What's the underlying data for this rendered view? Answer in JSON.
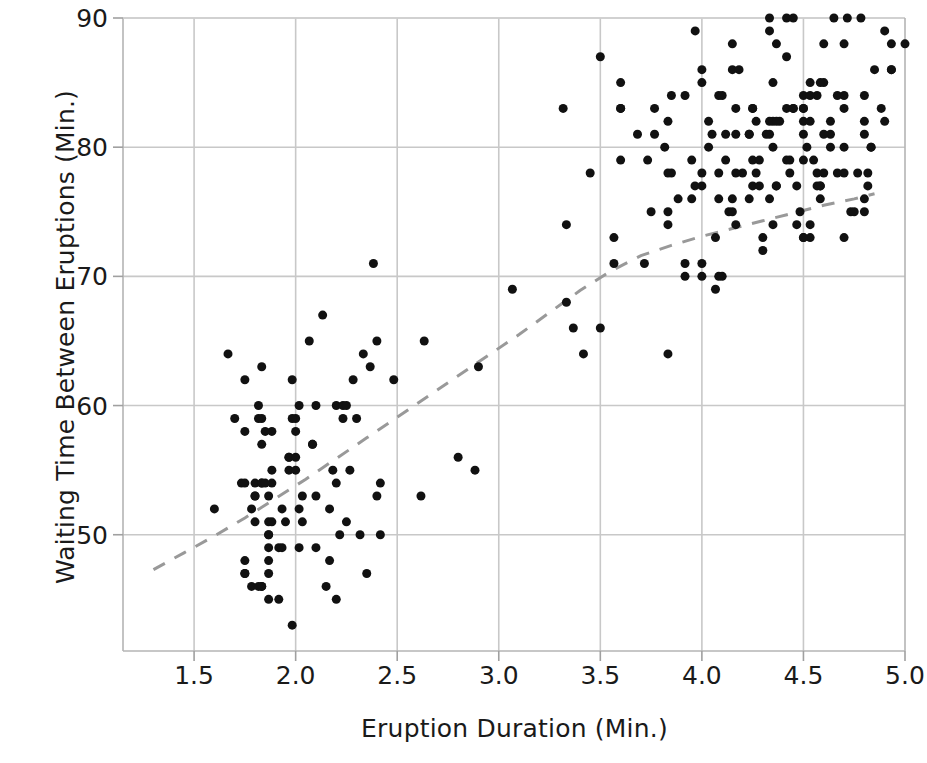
{
  "chart_data": {
    "type": "scatter",
    "title": "",
    "xlabel": "Eruption Duration (Min.)",
    "ylabel": "Waiting Time Between Eruptions (Min.)",
    "xlim": [
      1.15,
      5.0
    ],
    "ylim": [
      41.0,
      90.0
    ],
    "xticks": [
      1.5,
      2.0,
      2.5,
      3.0,
      3.5,
      4.0,
      4.5,
      5.0
    ],
    "xticklabels": [
      "1.5",
      "2.0",
      "2.5",
      "3.0",
      "3.5",
      "4.0",
      "4.5",
      "5.0"
    ],
    "yticks": [
      50,
      60,
      70,
      80,
      90
    ],
    "yticklabels": [
      "50",
      "60",
      "70",
      "80",
      "90"
    ],
    "grid": true,
    "grid_color": "#c8c8c8",
    "marker_color": "#111111",
    "marker_size": 9,
    "legend": "none",
    "series": [
      {
        "name": "Old Faithful eruptions",
        "marker": "circle",
        "points": [
          [
            3.6,
            79
          ],
          [
            1.8,
            54
          ],
          [
            3.333,
            74
          ],
          [
            2.283,
            62
          ],
          [
            4.533,
            85
          ],
          [
            2.883,
            55
          ],
          [
            4.7,
            88
          ],
          [
            3.6,
            85
          ],
          [
            1.95,
            51
          ],
          [
            4.35,
            85
          ],
          [
            1.833,
            54
          ],
          [
            3.917,
            84
          ],
          [
            4.2,
            78
          ],
          [
            1.75,
            47
          ],
          [
            4.7,
            83
          ],
          [
            2.167,
            52
          ],
          [
            1.75,
            62
          ],
          [
            4.8,
            84
          ],
          [
            1.6,
            52
          ],
          [
            4.25,
            79
          ],
          [
            1.8,
            51
          ],
          [
            1.75,
            47
          ],
          [
            3.45,
            78
          ],
          [
            3.067,
            69
          ],
          [
            4.533,
            74
          ],
          [
            3.6,
            83
          ],
          [
            1.967,
            55
          ],
          [
            4.083,
            76
          ],
          [
            3.85,
            78
          ],
          [
            4.433,
            79
          ],
          [
            4.3,
            73
          ],
          [
            4.467,
            77
          ],
          [
            3.367,
            66
          ],
          [
            4.033,
            80
          ],
          [
            3.833,
            74
          ],
          [
            2.017,
            52
          ],
          [
            1.867,
            48
          ],
          [
            4.833,
            80
          ],
          [
            1.833,
            59
          ],
          [
            4.783,
            90
          ],
          [
            4.35,
            80
          ],
          [
            1.883,
            58
          ],
          [
            4.567,
            84
          ],
          [
            1.75,
            58
          ],
          [
            4.533,
            73
          ],
          [
            3.317,
            83
          ],
          [
            3.833,
            64
          ],
          [
            2.1,
            53
          ],
          [
            4.633,
            82
          ],
          [
            2.0,
            59
          ],
          [
            4.8,
            75
          ],
          [
            4.716,
            90
          ],
          [
            1.833,
            54
          ],
          [
            4.833,
            80
          ],
          [
            1.733,
            54
          ],
          [
            4.883,
            83
          ],
          [
            3.717,
            71
          ],
          [
            1.667,
            64
          ],
          [
            4.567,
            77
          ],
          [
            4.317,
            81
          ],
          [
            2.233,
            59
          ],
          [
            4.5,
            84
          ],
          [
            1.75,
            48
          ],
          [
            4.8,
            82
          ],
          [
            1.817,
            60
          ],
          [
            4.4,
            92
          ],
          [
            4.167,
            78
          ],
          [
            4.7,
            78
          ],
          [
            2.067,
            65
          ],
          [
            4.7,
            73
          ],
          [
            4.033,
            82
          ],
          [
            1.967,
            56
          ],
          [
            4.5,
            79
          ],
          [
            4.0,
            71
          ],
          [
            1.983,
            62
          ],
          [
            5.067,
            76
          ],
          [
            2.017,
            60
          ],
          [
            4.567,
            78
          ],
          [
            3.883,
            76
          ],
          [
            3.6,
            83
          ],
          [
            4.133,
            75
          ],
          [
            4.333,
            82
          ],
          [
            4.1,
            70
          ],
          [
            2.633,
            65
          ],
          [
            4.067,
            73
          ],
          [
            4.933,
            88
          ],
          [
            3.95,
            76
          ],
          [
            4.517,
            80
          ],
          [
            2.167,
            48
          ],
          [
            4.0,
            86
          ],
          [
            2.2,
            60
          ],
          [
            4.333,
            90
          ],
          [
            1.867,
            50
          ],
          [
            4.817,
            78
          ],
          [
            1.833,
            63
          ],
          [
            4.3,
            72
          ],
          [
            4.667,
            84
          ],
          [
            3.75,
            75
          ],
          [
            1.867,
            51
          ],
          [
            4.9,
            82
          ],
          [
            2.483,
            62
          ],
          [
            4.367,
            88
          ],
          [
            2.1,
            49
          ],
          [
            4.5,
            83
          ],
          [
            4.05,
            81
          ],
          [
            1.867,
            47
          ],
          [
            4.7,
            84
          ],
          [
            1.783,
            52
          ],
          [
            4.85,
            86
          ],
          [
            3.683,
            81
          ],
          [
            4.733,
            75
          ],
          [
            2.3,
            59
          ],
          [
            4.9,
            89
          ],
          [
            4.417,
            79
          ],
          [
            1.7,
            59
          ],
          [
            4.633,
            81
          ],
          [
            2.317,
            50
          ],
          [
            4.6,
            85
          ],
          [
            1.817,
            59
          ],
          [
            4.417,
            87
          ],
          [
            2.617,
            53
          ],
          [
            4.067,
            69
          ],
          [
            4.25,
            77
          ],
          [
            1.967,
            56
          ],
          [
            4.6,
            88
          ],
          [
            3.767,
            81
          ],
          [
            1.917,
            45
          ],
          [
            4.5,
            82
          ],
          [
            2.267,
            55
          ],
          [
            4.65,
            90
          ],
          [
            1.867,
            45
          ],
          [
            4.167,
            83
          ],
          [
            2.8,
            56
          ],
          [
            4.333,
            89
          ],
          [
            1.833,
            46
          ],
          [
            4.383,
            82
          ],
          [
            1.883,
            51
          ],
          [
            4.933,
            86
          ],
          [
            2.033,
            53
          ],
          [
            3.733,
            79
          ],
          [
            4.233,
            81
          ],
          [
            2.233,
            60
          ],
          [
            4.533,
            82
          ],
          [
            4.817,
            77
          ],
          [
            4.333,
            76
          ],
          [
            1.983,
            59
          ],
          [
            4.633,
            80
          ],
          [
            2.017,
            49
          ],
          [
            5.1,
            96
          ],
          [
            1.8,
            53
          ],
          [
            5.033,
            77
          ],
          [
            4.0,
            77
          ],
          [
            2.4,
            65
          ],
          [
            4.6,
            81
          ],
          [
            3.567,
            71
          ],
          [
            4.0,
            70
          ],
          [
            4.5,
            81
          ],
          [
            4.083,
            93
          ],
          [
            1.8,
            53
          ],
          [
            3.967,
            89
          ],
          [
            2.2,
            45
          ],
          [
            4.15,
            86
          ],
          [
            2.0,
            58
          ],
          [
            3.833,
            78
          ],
          [
            3.5,
            66
          ],
          [
            4.583,
            76
          ],
          [
            2.367,
            63
          ],
          [
            5.0,
            88
          ],
          [
            1.933,
            52
          ],
          [
            4.617,
            93
          ],
          [
            1.917,
            49
          ],
          [
            2.083,
            57
          ],
          [
            4.583,
            77
          ],
          [
            3.333,
            68
          ],
          [
            4.167,
            81
          ],
          [
            4.333,
            81
          ],
          [
            4.5,
            73
          ],
          [
            2.417,
            50
          ],
          [
            4.0,
            85
          ],
          [
            4.167,
            74
          ],
          [
            1.883,
            55
          ],
          [
            4.583,
            77
          ],
          [
            4.25,
            83
          ],
          [
            3.767,
            83
          ],
          [
            2.033,
            51
          ],
          [
            4.433,
            78
          ],
          [
            4.083,
            84
          ],
          [
            1.833,
            46
          ],
          [
            4.417,
            83
          ],
          [
            2.183,
            55
          ],
          [
            4.8,
            81
          ],
          [
            1.833,
            57
          ],
          [
            4.8,
            76
          ],
          [
            4.1,
            84
          ],
          [
            3.966,
            77
          ],
          [
            4.233,
            81
          ],
          [
            3.5,
            87
          ],
          [
            4.366,
            77
          ],
          [
            2.25,
            51
          ],
          [
            4.667,
            78
          ],
          [
            2.1,
            60
          ],
          [
            4.35,
            82
          ],
          [
            4.133,
            91
          ],
          [
            1.867,
            53
          ],
          [
            4.6,
            78
          ],
          [
            1.783,
            46
          ],
          [
            4.367,
            77
          ],
          [
            3.85,
            84
          ],
          [
            1.933,
            49
          ],
          [
            4.5,
            83
          ],
          [
            2.383,
            71
          ],
          [
            4.7,
            80
          ],
          [
            1.867,
            49
          ],
          [
            3.833,
            75
          ],
          [
            3.417,
            64
          ],
          [
            4.233,
            76
          ],
          [
            2.4,
            53
          ],
          [
            4.8,
            94
          ],
          [
            2.0,
            55
          ],
          [
            4.15,
            76
          ],
          [
            1.867,
            50
          ],
          [
            4.267,
            82
          ],
          [
            1.75,
            54
          ],
          [
            4.483,
            75
          ],
          [
            4.0,
            78
          ],
          [
            4.117,
            79
          ],
          [
            4.083,
            78
          ],
          [
            4.267,
            78
          ],
          [
            3.917,
            70
          ],
          [
            4.55,
            79
          ],
          [
            4.083,
            70
          ],
          [
            2.417,
            54
          ],
          [
            4.183,
            86
          ],
          [
            2.217,
            50
          ],
          [
            4.45,
            90
          ],
          [
            1.883,
            54
          ],
          [
            1.85,
            54
          ],
          [
            4.283,
            77
          ],
          [
            3.95,
            79
          ],
          [
            2.333,
            64
          ],
          [
            4.15,
            75
          ],
          [
            2.35,
            47
          ],
          [
            4.933,
            86
          ],
          [
            2.9,
            63
          ],
          [
            4.583,
            85
          ],
          [
            3.833,
            82
          ],
          [
            2.083,
            57
          ],
          [
            4.367,
            82
          ],
          [
            2.133,
            67
          ],
          [
            4.35,
            74
          ],
          [
            2.2,
            54
          ],
          [
            4.45,
            83
          ],
          [
            3.567,
            73
          ],
          [
            4.5,
            73
          ],
          [
            4.15,
            88
          ],
          [
            3.817,
            80
          ],
          [
            3.917,
            71
          ],
          [
            4.45,
            83
          ],
          [
            2.0,
            56
          ],
          [
            4.283,
            79
          ],
          [
            4.767,
            78
          ],
          [
            4.533,
            84
          ],
          [
            1.85,
            58
          ],
          [
            4.25,
            83
          ],
          [
            1.983,
            43
          ],
          [
            2.25,
            60
          ],
          [
            4.75,
            75
          ],
          [
            4.117,
            81
          ],
          [
            2.15,
            46
          ],
          [
            4.417,
            90
          ],
          [
            1.817,
            46
          ],
          [
            4.467,
            74
          ]
        ]
      }
    ],
    "trendline": {
      "name": "lowess-smoother",
      "style": "dashed",
      "color": "#999999",
      "width": 3,
      "points": [
        [
          1.3,
          47.3
        ],
        [
          1.45,
          48.6
        ],
        [
          1.6,
          49.9
        ],
        [
          1.75,
          51.3
        ],
        [
          1.9,
          52.8
        ],
        [
          2.05,
          54.3
        ],
        [
          2.2,
          55.9
        ],
        [
          2.35,
          57.5
        ],
        [
          2.5,
          59.1
        ],
        [
          2.65,
          60.7
        ],
        [
          2.8,
          62.3
        ],
        [
          2.95,
          63.9
        ],
        [
          3.1,
          65.5
        ],
        [
          3.25,
          67.2
        ],
        [
          3.4,
          68.9
        ],
        [
          3.55,
          70.4
        ],
        [
          3.7,
          71.6
        ],
        [
          3.85,
          72.4
        ],
        [
          4.0,
          73.1
        ],
        [
          4.15,
          73.7
        ],
        [
          4.3,
          74.3
        ],
        [
          4.45,
          74.9
        ],
        [
          4.6,
          75.5
        ],
        [
          4.75,
          76.0
        ],
        [
          4.85,
          76.4
        ]
      ]
    }
  },
  "axes": {
    "x_label": "Eruption Duration (Min.)",
    "y_label": "Waiting Time Between Eruptions (Min.)"
  }
}
